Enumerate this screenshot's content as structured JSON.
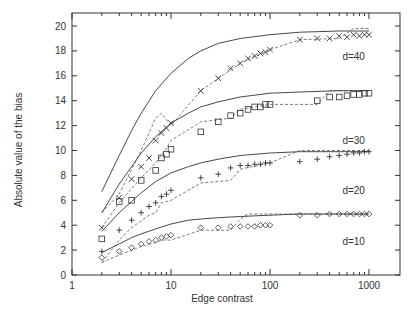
{
  "chart_data": {
    "type": "line",
    "title": "",
    "xlabel": "Edge contrast",
    "ylabel": "Absolute value of the bias",
    "xscale": "log",
    "xlim": [
      1,
      2000
    ],
    "ylim": [
      0,
      21
    ],
    "xticks": [
      1,
      10,
      100,
      1000
    ],
    "xtick_labels": [
      "1",
      "10",
      "100",
      "1000"
    ],
    "yticks": [
      0,
      2,
      4,
      6,
      8,
      10,
      12,
      14,
      16,
      18,
      20
    ],
    "ytick_labels": [
      "0",
      "2",
      "4",
      "6",
      "8",
      "10",
      "12",
      "14",
      "16",
      "18",
      "20"
    ],
    "grid": false,
    "legend": "none (inline labels)",
    "annotations": [
      "d=40",
      "d=30",
      "d=20",
      "d=10"
    ],
    "series": [
      {
        "name": "d=40",
        "label_pos": [
          700,
          17.3
        ],
        "theory": {
          "x": [
            2,
            3,
            4,
            5,
            7,
            10,
            15,
            20,
            30,
            50,
            100,
            200,
            500,
            1000
          ],
          "y": [
            6.7,
            9.6,
            11.6,
            13.0,
            14.8,
            16.2,
            17.4,
            18.0,
            18.6,
            19.0,
            19.3,
            19.5,
            19.6,
            19.6
          ]
        },
        "simulation": {
          "marker": "x",
          "x": [
            2,
            3,
            4,
            5,
            6,
            7,
            8,
            9,
            10,
            20,
            30,
            40,
            50,
            60,
            70,
            80,
            90,
            100,
            200,
            300,
            400,
            500,
            600,
            700,
            800,
            900,
            1000
          ],
          "y": [
            3.8,
            6.2,
            7.7,
            8.7,
            9.4,
            10.8,
            11.4,
            11.8,
            12.2,
            14.8,
            15.8,
            16.6,
            17.0,
            17.4,
            17.6,
            17.8,
            17.9,
            18.1,
            18.9,
            19.0,
            19.0,
            19.2,
            19.1,
            19.3,
            19.2,
            19.3,
            19.3
          ]
        },
        "dashed": {
          "x": [
            2,
            3,
            5,
            7,
            8,
            10,
            20,
            50,
            100,
            200,
            500,
            700,
            1000
          ],
          "y": [
            5.0,
            6.5,
            10.0,
            12.6,
            13.0,
            12.0,
            14.8,
            17.0,
            18.1,
            18.9,
            19.0,
            19.8,
            19.8
          ]
        }
      },
      {
        "name": "d=30",
        "label_pos": [
          700,
          10.5
        ],
        "theory": {
          "x": [
            2,
            3,
            4,
            5,
            7,
            10,
            15,
            20,
            30,
            50,
            100,
            200,
            500,
            1000
          ],
          "y": [
            5.0,
            7.3,
            8.7,
            9.8,
            11.1,
            12.2,
            13.0,
            13.5,
            13.9,
            14.3,
            14.6,
            14.7,
            14.8,
            14.8
          ]
        },
        "simulation": {
          "marker": "square",
          "x": [
            2,
            3,
            4,
            5,
            7,
            8,
            9,
            10,
            20,
            30,
            40,
            50,
            60,
            70,
            80,
            90,
            100,
            300,
            400,
            500,
            600,
            700,
            800,
            900,
            1000
          ],
          "y": [
            2.9,
            5.9,
            6.0,
            7.6,
            8.4,
            9.4,
            9.7,
            10.1,
            11.5,
            12.3,
            12.8,
            13.0,
            13.3,
            13.5,
            13.5,
            13.7,
            13.7,
            14.0,
            14.3,
            14.3,
            14.4,
            14.5,
            14.5,
            14.6,
            14.6
          ]
        },
        "dashed": {
          "x": [
            2,
            3,
            5,
            7,
            9,
            10,
            20,
            40,
            50,
            100,
            200,
            300,
            400,
            1000
          ],
          "y": [
            3.8,
            5.8,
            7.8,
            9.0,
            10.2,
            10.8,
            12.3,
            12.6,
            13.3,
            13.7,
            13.7,
            13.7,
            14.8,
            14.8
          ]
        }
      },
      {
        "name": "d=20",
        "label_pos": [
          700,
          6.5
        ],
        "theory": {
          "x": [
            2,
            3,
            4,
            5,
            7,
            10,
            15,
            20,
            30,
            50,
            100,
            200,
            500,
            1000
          ],
          "y": [
            3.5,
            5.0,
            5.9,
            6.6,
            7.5,
            8.2,
            8.7,
            9.0,
            9.3,
            9.6,
            9.8,
            9.9,
            9.9,
            9.9
          ]
        },
        "simulation": {
          "marker": "plus",
          "x": [
            2,
            3,
            4,
            5,
            6,
            7,
            8,
            9,
            10,
            20,
            30,
            40,
            50,
            60,
            70,
            80,
            90,
            100,
            200,
            300,
            400,
            500,
            600,
            700,
            800,
            900,
            1000
          ],
          "y": [
            1.9,
            3.6,
            4.4,
            5.0,
            5.5,
            5.8,
            6.3,
            6.5,
            6.8,
            7.8,
            8.1,
            8.6,
            8.8,
            8.8,
            8.9,
            8.9,
            9.0,
            9.0,
            9.1,
            9.3,
            9.5,
            9.6,
            9.7,
            9.8,
            9.8,
            9.9,
            9.9
          ]
        },
        "dashed": {
          "x": [
            2,
            3,
            4,
            6,
            7,
            8,
            10,
            20,
            40,
            50,
            100,
            200,
            1000
          ],
          "y": [
            1.0,
            2.8,
            3.8,
            4.8,
            5.0,
            5.8,
            6.0,
            7.4,
            7.6,
            8.5,
            9.0,
            10.0,
            10.0
          ]
        }
      },
      {
        "name": "d=10",
        "label_pos": [
          700,
          2.4
        ],
        "theory": {
          "x": [
            2,
            3,
            4,
            5,
            7,
            10,
            15,
            20,
            30,
            50,
            100,
            200,
            500,
            1000
          ],
          "y": [
            1.8,
            2.5,
            3.0,
            3.3,
            3.7,
            4.1,
            4.4,
            4.5,
            4.6,
            4.7,
            4.8,
            4.9,
            4.9,
            4.9
          ]
        },
        "simulation": {
          "marker": "diamond",
          "x": [
            2,
            3,
            4,
            5,
            6,
            7,
            8,
            9,
            10,
            20,
            30,
            40,
            50,
            60,
            70,
            80,
            90,
            100,
            200,
            300,
            400,
            500,
            600,
            700,
            800,
            900,
            1000
          ],
          "y": [
            1.4,
            1.9,
            2.2,
            2.5,
            2.7,
            2.8,
            3.0,
            3.1,
            3.2,
            3.8,
            3.8,
            3.9,
            3.9,
            3.9,
            3.9,
            4.0,
            4.0,
            4.0,
            4.8,
            4.8,
            4.9,
            4.9,
            4.9,
            4.9,
            4.9,
            4.9,
            4.9
          ]
        },
        "dashed": {
          "x": [
            2,
            3,
            5,
            7,
            8,
            10,
            20,
            40,
            50,
            60,
            100,
            200,
            1000
          ],
          "y": [
            1.0,
            1.6,
            2.3,
            2.6,
            2.8,
            2.8,
            3.6,
            3.6,
            4.5,
            4.9,
            4.9,
            4.9,
            4.9
          ]
        }
      }
    ]
  }
}
